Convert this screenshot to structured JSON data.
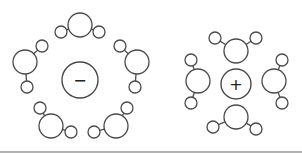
{
  "diagram": {
    "title": "",
    "colors": {
      "stroke": "#4a4a4a",
      "fill": "#ffffff",
      "baseline": "#9a9a9a"
    },
    "clusters": [
      {
        "name": "anion-hydration-shell",
        "ion": {
          "label": "−",
          "charge": "negative",
          "cx": 80,
          "cy": 80,
          "r": 18
        },
        "waters": [
          {
            "o": [
              80,
              25
            ],
            "h": [
              [
                61,
                32
              ],
              [
                99,
                32
              ]
            ]
          },
          {
            "o": [
              25,
              62
            ],
            "h": [
              [
                42,
                46
              ],
              [
                27,
                87
              ]
            ]
          },
          {
            "o": [
              137,
              62
            ],
            "h": [
              [
                120,
                46
              ],
              [
                135,
                87
              ]
            ]
          },
          {
            "o": [
              51,
              126
            ],
            "h": [
              [
                40,
                108
              ],
              [
                71,
                132
              ]
            ]
          },
          {
            "o": [
              116,
              126
            ],
            "h": [
              [
                127,
                108
              ],
              [
                94,
                132
              ]
            ]
          }
        ]
      },
      {
        "name": "cation-hydration-shell",
        "ion": {
          "label": "+",
          "charge": "positive",
          "cx": 236,
          "cy": 84,
          "r": 15
        },
        "waters": [
          {
            "o": [
              236,
              51
            ],
            "h": [
              [
                215,
                38
              ],
              [
                256,
                38
              ]
            ]
          },
          {
            "o": [
              236,
              117
            ],
            "h": [
              [
                213,
                127
              ],
              [
                256,
                129
              ]
            ]
          },
          {
            "o": [
              198,
              81
            ],
            "h": [
              [
                191,
                60
              ],
              [
                191,
                103
              ]
            ]
          },
          {
            "o": [
              274,
              81
            ],
            "h": [
              [
                282,
                60
              ],
              [
                282,
                103
              ]
            ]
          }
        ]
      }
    ],
    "sizes": {
      "oxygen_r": 12,
      "hydrogen_r": 6
    }
  }
}
